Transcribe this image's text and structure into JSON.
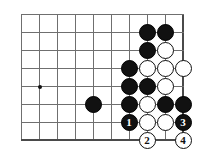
{
  "board": {
    "type": "go-board-diagram",
    "description": "Go (igo/baduk) life-and-death problem diagram, bottom-right corner",
    "grid": {
      "columns": 10,
      "rows": 8,
      "origin_x": 21,
      "origin_y": 14,
      "spacing": 18,
      "line_color": "#6f6f6f",
      "edge_color": "#4a4a4a",
      "background": "#ffffff",
      "right_edge_col": 9,
      "bottom_edge_row": 7
    },
    "hoshi": [
      {
        "col": 1,
        "row": 4
      }
    ],
    "stones": [
      {
        "col": 7,
        "row": 1,
        "color": "black",
        "label": ""
      },
      {
        "col": 8,
        "row": 1,
        "color": "black",
        "label": ""
      },
      {
        "col": 7,
        "row": 2,
        "color": "black",
        "label": ""
      },
      {
        "col": 8,
        "row": 2,
        "color": "white",
        "label": ""
      },
      {
        "col": 6,
        "row": 3,
        "color": "black",
        "label": ""
      },
      {
        "col": 7,
        "row": 3,
        "color": "white",
        "label": ""
      },
      {
        "col": 8,
        "row": 3,
        "color": "white",
        "label": ""
      },
      {
        "col": 9,
        "row": 3,
        "color": "white",
        "label": ""
      },
      {
        "col": 6,
        "row": 4,
        "color": "black",
        "label": ""
      },
      {
        "col": 7,
        "row": 4,
        "color": "black",
        "label": ""
      },
      {
        "col": 8,
        "row": 4,
        "color": "white",
        "label": ""
      },
      {
        "col": 4,
        "row": 5,
        "color": "black",
        "label": ""
      },
      {
        "col": 6,
        "row": 5,
        "color": "black",
        "label": ""
      },
      {
        "col": 7,
        "row": 5,
        "color": "white",
        "label": ""
      },
      {
        "col": 8,
        "row": 5,
        "color": "black",
        "label": ""
      },
      {
        "col": 9,
        "row": 5,
        "color": "black",
        "label": ""
      },
      {
        "col": 6,
        "row": 6,
        "color": "black",
        "label": "1"
      },
      {
        "col": 7,
        "row": 6,
        "color": "white",
        "label": ""
      },
      {
        "col": 8,
        "row": 6,
        "color": "white",
        "label": ""
      },
      {
        "col": 9,
        "row": 6,
        "color": "black",
        "label": "3"
      },
      {
        "col": 7,
        "row": 7,
        "color": "white",
        "label": "2"
      },
      {
        "col": 9,
        "row": 7,
        "color": "white",
        "label": "4"
      }
    ]
  }
}
